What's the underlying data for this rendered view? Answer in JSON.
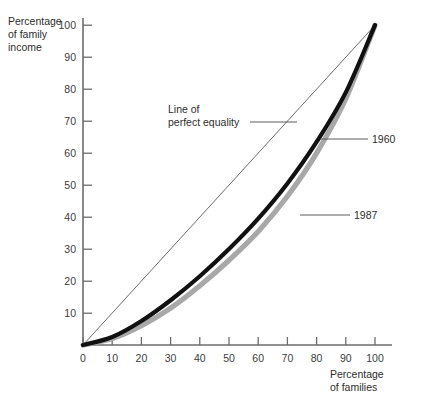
{
  "chart_data": {
    "type": "line",
    "title": "",
    "xlabel": "Percentage of families",
    "ylabel": "Percentage of family income",
    "xlim": [
      0,
      103
    ],
    "ylim": [
      0,
      103
    ],
    "grid": false,
    "legend_position": "inline-annotations",
    "x_ticks": [
      0,
      10,
      20,
      30,
      40,
      50,
      60,
      70,
      80,
      90,
      100
    ],
    "y_ticks": [
      10,
      20,
      30,
      40,
      50,
      60,
      70,
      80,
      90,
      100
    ],
    "x": [
      0,
      10,
      20,
      30,
      40,
      50,
      60,
      70,
      80,
      90,
      100
    ],
    "series": [
      {
        "name": "Line of perfect equality",
        "color": "#5a5a5a",
        "values": [
          0,
          10,
          20,
          30,
          40,
          50,
          60,
          70,
          80,
          90,
          100
        ]
      },
      {
        "name": "1960",
        "color": "#111111",
        "values": [
          0,
          2.5,
          7.5,
          14,
          21.5,
          30,
          39.5,
          50.5,
          63.5,
          79,
          100
        ]
      },
      {
        "name": "1987",
        "color": "#a8a8a8",
        "values": [
          0,
          2,
          6,
          11.5,
          18.5,
          26.5,
          35.5,
          46.5,
          60,
          77,
          100
        ]
      }
    ],
    "annotations": [
      {
        "text": "Line of perfect equality",
        "target_series": "Line of perfect equality"
      },
      {
        "text": "1960",
        "target_series": "1960"
      },
      {
        "text": "1987",
        "target_series": "1987"
      }
    ]
  },
  "axes": {
    "y_label_line1": "Percentage",
    "y_label_line2": "of family",
    "y_label_line3": "income",
    "x_label_line1": "Percentage",
    "x_label_line2": "of families",
    "y_tick_labels": [
      "100",
      "90",
      "80",
      "70",
      "60",
      "50",
      "40",
      "30",
      "20",
      "10"
    ],
    "x_tick_labels": [
      "0",
      "10",
      "20",
      "30",
      "40",
      "50",
      "60",
      "70",
      "80",
      "90",
      "100"
    ]
  },
  "annotations": {
    "equality_line1": "Line of",
    "equality_line2": "perfect equality",
    "label_1960": "1960",
    "label_1987": "1987"
  },
  "colors": {
    "curve_1960": "#111111",
    "curve_1987": "#a8a8a8",
    "axis": "#6d6d6d",
    "text": "#2e2e2e"
  }
}
